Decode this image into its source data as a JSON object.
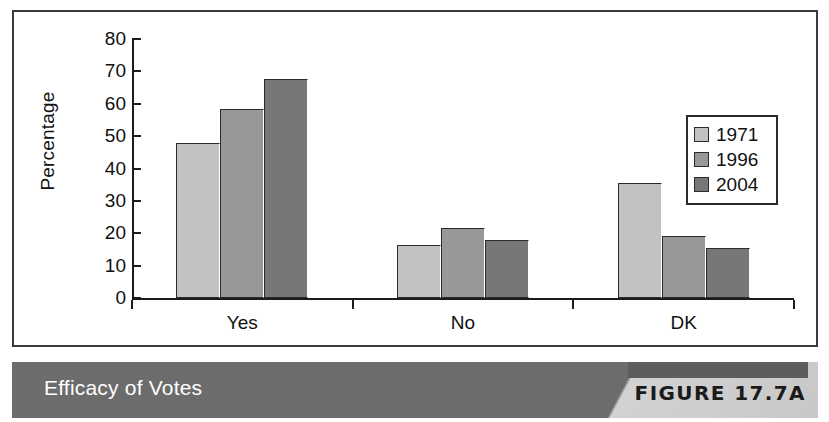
{
  "figure": {
    "caption_title": "Efficacy of Votes",
    "figure_number": "FIGURE 17.7A"
  },
  "chart_data": {
    "type": "bar",
    "title": "Efficacy of Votes",
    "xlabel": "",
    "ylabel": "Percentage",
    "categories": [
      "Yes",
      "No",
      "DK"
    ],
    "series": [
      {
        "name": "1971",
        "color": "#c2c2c2",
        "values": [
          48.0,
          16.3,
          35.5
        ]
      },
      {
        "name": "1996",
        "color": "#989898",
        "values": [
          58.5,
          21.5,
          19.3
        ]
      },
      {
        "name": "2004",
        "color": "#777777",
        "values": [
          67.5,
          17.8,
          15.3
        ]
      }
    ],
    "ylim": [
      0,
      80
    ],
    "yticks": [
      0,
      10,
      20,
      30,
      40,
      50,
      60,
      70,
      80
    ],
    "ytick_labels": [
      "0",
      "10",
      "20",
      "30",
      "40",
      "50",
      "60",
      "70",
      "80"
    ],
    "grid": false,
    "legend_position": "right"
  }
}
